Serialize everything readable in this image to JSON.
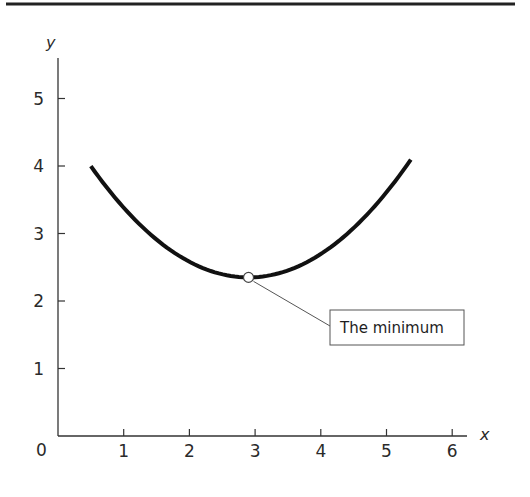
{
  "chart_data": {
    "type": "line",
    "title": "",
    "xlabel": "x",
    "ylabel": "y",
    "xlim": [
      0,
      6.2
    ],
    "ylim": [
      0,
      5.6
    ],
    "x_ticks": [
      1,
      2,
      3,
      4,
      5,
      6
    ],
    "y_ticks": [
      1,
      2,
      3,
      4,
      5
    ],
    "origin_label": "0",
    "grid": false,
    "legend": null,
    "series": [
      {
        "name": "curve",
        "description": "U-shaped (convex) curve with a single minimum",
        "vertex": [
          2.9,
          2.35
        ],
        "coefficient_a": 0.286,
        "x_range": [
          0.5,
          5.37
        ],
        "points": [
          {
            "x": 0.5,
            "y": 4.0
          },
          {
            "x": 1.0,
            "y": 3.38
          },
          {
            "x": 1.5,
            "y": 2.91
          },
          {
            "x": 2.0,
            "y": 2.58
          },
          {
            "x": 2.5,
            "y": 2.4
          },
          {
            "x": 2.9,
            "y": 2.35
          },
          {
            "x": 3.5,
            "y": 2.45
          },
          {
            "x": 4.0,
            "y": 2.7
          },
          {
            "x": 4.5,
            "y": 3.08
          },
          {
            "x": 5.0,
            "y": 3.61
          },
          {
            "x": 5.37,
            "y": 4.05
          }
        ],
        "color": "#111111"
      }
    ],
    "annotations": [
      {
        "text": "The minimum",
        "point": [
          2.9,
          2.35
        ],
        "marker": "open-circle",
        "box": true
      }
    ]
  },
  "colors": {
    "axis": "#333333",
    "curve": "#111111",
    "top_rule": "#222222",
    "leader": "#555555"
  },
  "labels": {
    "x_axis": "x",
    "y_axis": "y",
    "origin": "0",
    "annotation": "The minimum",
    "x_tick_1": "1",
    "x_tick_2": "2",
    "x_tick_3": "3",
    "x_tick_4": "4",
    "x_tick_5": "5",
    "x_tick_6": "6",
    "y_tick_1": "1",
    "y_tick_2": "2",
    "y_tick_3": "3",
    "y_tick_4": "4",
    "y_tick_5": "5"
  }
}
